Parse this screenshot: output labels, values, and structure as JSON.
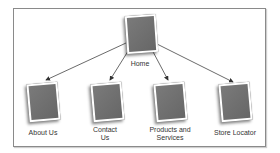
{
  "diagram": {
    "type": "sitemap",
    "root": {
      "label": "Home"
    },
    "children": [
      {
        "label": "About Us"
      },
      {
        "label": "Contact Us"
      },
      {
        "label": "Products and Services"
      },
      {
        "label": "Store Locator"
      }
    ],
    "colors": {
      "page_fill": "#6f6f6f",
      "frame": "#8a8a8a",
      "arrow": "#333333"
    }
  }
}
